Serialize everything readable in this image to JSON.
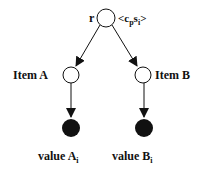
{
  "diagram": {
    "root": {
      "label": "r",
      "annotation_open": "<c",
      "annotation_sub1": "p",
      "annotation_mid": "s",
      "annotation_sub2": "i",
      "annotation_close": ">"
    },
    "children": [
      {
        "label": "Item A",
        "value_label": "value A",
        "value_sub": "i"
      },
      {
        "label": "Item B",
        "value_label": "value B",
        "value_sub": "i"
      }
    ],
    "colors": {
      "stroke": "#111111",
      "fill_leaf": "#111111",
      "fill_node": "#ffffff"
    }
  }
}
